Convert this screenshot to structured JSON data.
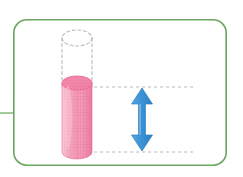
{
  "figure": {
    "title": "Cylinder volume change diagram",
    "description": "A rounded rectangular panel containing a pink grid-textured cylinder, a dashed outline showing its original taller shape, two horizontal dashed reference lines, and a blue double-headed vertical arrow indicating the height difference.",
    "canvas": {
      "width": 243,
      "height": 177,
      "background": "#ffffff"
    }
  },
  "panel": {
    "label": "rounded-panel",
    "x": 13,
    "y": 19,
    "width": 214,
    "height": 147,
    "corner_radius": 13,
    "stroke_color": "#6aa65f",
    "stroke_width": 1.6,
    "fill_color": "#ffffff"
  },
  "connector": {
    "label": "left-connector-line",
    "x1": 0,
    "y1": 113,
    "x2": 13,
    "y2": 113,
    "stroke_color": "#8cbf80",
    "stroke_width": 1.6
  },
  "cylinder_solid": {
    "label": "pink-cylinder",
    "center_x": 77,
    "left_x": 62,
    "right_x": 92,
    "top_y": 83,
    "bottom_y": 152,
    "ellipse_rx": 15,
    "ellipse_ry": 7,
    "body_fill": "#f497b4",
    "top_fill": "#f07fa3",
    "edge_color": "#e8618d",
    "grid_color": "#e06a95",
    "grid_spacing": 3.2,
    "highlight_color": "#fbc7d7"
  },
  "cylinder_ghost": {
    "label": "dashed-cylinder-outline",
    "center_x": 77,
    "left_x": 62,
    "right_x": 92,
    "top_y": 38,
    "bottom_y": 87,
    "ellipse_rx": 15,
    "ellipse_ry": 8,
    "stroke_color": "#b9b9c4",
    "stroke_width": 1.1,
    "dash_pattern": "3 2.6"
  },
  "reference_lines": [
    {
      "label": "upper-dashed-reference-line",
      "y": 87,
      "x1": 88,
      "x2": 196,
      "stroke_color": "#c2b8c8",
      "stroke_width": 1,
      "dash_pattern": "3.2 2.8"
    },
    {
      "label": "lower-dashed-reference-line",
      "y": 152,
      "x1": 88,
      "x2": 196,
      "stroke_color": "#c2b8c8",
      "stroke_width": 1,
      "dash_pattern": "3.2 2.8"
    }
  ],
  "arrow": {
    "label": "height-difference-arrow",
    "center_x": 142,
    "top_y": 88,
    "bottom_y": 151,
    "shaft_width": 7,
    "head_width": 21,
    "head_height": 16,
    "fill_color": "#3c93d6",
    "edge_color": "#2f7fc0",
    "direction": "double-headed-vertical"
  },
  "colors": {
    "panel_green": "#6aa65f",
    "cylinder_pink": "#f497b4",
    "cylinder_pink_dark": "#e8618d",
    "arrow_blue": "#3c93d6",
    "dash_gray": "#b9b9c4",
    "background": "#ffffff"
  }
}
